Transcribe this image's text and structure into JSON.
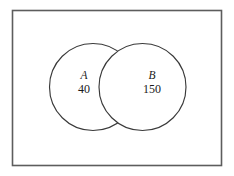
{
  "figure": {
    "kind": "venn-diagram",
    "title": "",
    "background_color": "#ffffff",
    "frame": {
      "border_color": "#5d5d5d",
      "fill_color": "#ffffff"
    },
    "outline_color": "#3a3a3a",
    "intersection_fill_color": "#bcbcbc"
  },
  "sets": [
    {
      "label": "A",
      "count": "40"
    },
    {
      "label": "B",
      "count": "150"
    }
  ],
  "intersection": {
    "label": "",
    "count": "",
    "shaded": "true"
  }
}
